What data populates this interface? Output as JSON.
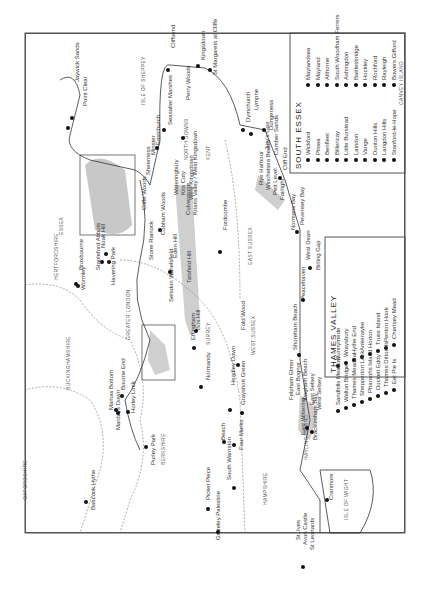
{
  "map": {
    "orientation": "rotated 90 degrees counter-clockwise",
    "insets": [
      {
        "title": "SOUTH ESSEX",
        "x": 290,
        "y": 33,
        "w": 115,
        "h": 140
      },
      {
        "title": "THAMES VALLEY",
        "x": 325,
        "y": 237,
        "w": 80,
        "h": 140
      }
    ],
    "counties": [
      {
        "name": "ESSEX",
        "x": 58,
        "y": 235
      },
      {
        "name": "HERTFORDSHIRE",
        "x": 53,
        "y": 280
      },
      {
        "name": "BUCKINGHAMSHIRE",
        "x": 65,
        "y": 390
      },
      {
        "name": "OXFORDSHIRE",
        "x": 22,
        "y": 500
      },
      {
        "name": "BERKSHIRE",
        "x": 160,
        "y": 465
      },
      {
        "name": "GREATER LONDON",
        "x": 125,
        "y": 340
      },
      {
        "name": "SURREY",
        "x": 205,
        "y": 345
      },
      {
        "name": "KENT",
        "x": 205,
        "y": 160
      },
      {
        "name": "NORTH DOWNS",
        "x": 183,
        "y": 160
      },
      {
        "name": "ISLE OF SHEPPEY",
        "x": 140,
        "y": 105
      },
      {
        "name": "EAST SUSSEX",
        "x": 247,
        "y": 265
      },
      {
        "name": "WEST SUSSEX",
        "x": 250,
        "y": 355
      },
      {
        "name": "HAMPSHIRE",
        "x": 262,
        "y": 505
      },
      {
        "name": "ISLE OF WIGHT",
        "x": 343,
        "y": 520
      },
      {
        "name": "HAYLING ISLAND",
        "x": 303,
        "y": 460
      },
      {
        "name": "CANVEY ISLAND",
        "x": 398,
        "y": 105
      }
    ],
    "places": [
      {
        "name": "Jaywick Sands",
        "x": 74,
        "y": 82,
        "dot": [
          72,
          118
        ]
      },
      {
        "name": "Point Clear",
        "x": 82,
        "y": 106,
        "dot": [
          68,
          128
        ]
      },
      {
        "name": "Sheerness",
        "x": 145,
        "y": 175
      },
      {
        "name": "Minster",
        "x": 150,
        "y": 155
      },
      {
        "name": "Eastchurch",
        "x": 155,
        "y": 145,
        "dot": [
          157,
          148
        ]
      },
      {
        "name": "Seasalter Marshes",
        "x": 167,
        "y": 125,
        "dot": [
          164,
          130
        ]
      },
      {
        "name": "Perry Woods",
        "x": 185,
        "y": 100,
        "dot": [
          183,
          138
        ]
      },
      {
        "name": "Kingsdown",
        "x": 200,
        "y": 60,
        "dot": [
          198,
          66
        ]
      },
      {
        "name": "Cliffsend",
        "x": 170,
        "y": 48,
        "dot": [
          168,
          70
        ]
      },
      {
        "name": "St Margarets at Cliffe",
        "x": 212,
        "y": 75,
        "dot": [
          210,
          70
        ]
      },
      {
        "name": "Dymchurch",
        "x": 245,
        "y": 122,
        "dot": [
          243,
          130
        ]
      },
      {
        "name": "Lympne",
        "x": 253,
        "y": 110,
        "dot": [
          251,
          134
        ]
      },
      {
        "name": "Dungeness",
        "x": 268,
        "y": 130,
        "dot": [
          264,
          130
        ]
      },
      {
        "name": "Jury's Gap",
        "x": 264,
        "y": 150
      },
      {
        "name": "Camber Sands",
        "x": 273,
        "y": 155
      },
      {
        "name": "Cliff End",
        "x": 282,
        "y": 170,
        "dot": [
          280,
          178
        ]
      },
      {
        "name": "Rye Harbour",
        "x": 258,
        "y": 185
      },
      {
        "name": "Winchelsea Beach",
        "x": 265,
        "y": 190
      },
      {
        "name": "Pett Level",
        "x": 272,
        "y": 195
      },
      {
        "name": "Fairlight",
        "x": 279,
        "y": 200
      },
      {
        "name": "Wateringbury",
        "x": 173,
        "y": 195
      },
      {
        "name": "Kits Coty",
        "x": 180,
        "y": 195
      },
      {
        "name": "West Kingsdown",
        "x": 188,
        "y": 200
      },
      {
        "name": "Culverstone",
        "x": 185,
        "y": 215
      },
      {
        "name": "Knatts Valley / West Kingsdown",
        "x": 192,
        "y": 215
      },
      {
        "name": "Cliffe Woods",
        "x": 141,
        "y": 210
      },
      {
        "name": "Cobham Woods",
        "x": 160,
        "y": 235,
        "dot": [
          160,
          230
        ]
      },
      {
        "name": "Stone Rainock",
        "x": 148,
        "y": 260
      },
      {
        "name": "Fordcombe",
        "x": 222,
        "y": 230,
        "dot": [
          220,
          252
        ]
      },
      {
        "name": "Eden Hill",
        "x": 172,
        "y": 258
      },
      {
        "name": "Chelsfield",
        "x": 168,
        "y": 275,
        "dot": [
          170,
          272
        ]
      },
      {
        "name": "Tatsfield Hill",
        "x": 186,
        "y": 283
      },
      {
        "name": "Selsdon Wd",
        "x": 168,
        "y": 302
      },
      {
        "name": "Box Hill",
        "x": 195,
        "y": 330,
        "dot": [
          196,
          331
        ]
      },
      {
        "name": "Effingham",
        "x": 190,
        "y": 340,
        "dot": [
          194,
          348
        ]
      },
      {
        "name": "Normandy",
        "x": 205,
        "y": 380,
        "dot": [
          201,
          387
        ]
      },
      {
        "name": "Fold Wood",
        "x": 240,
        "y": 330,
        "dot": [
          238,
          365
        ]
      },
      {
        "name": "Headley Down",
        "x": 230,
        "y": 385,
        "dot": [
          230,
          410
        ]
      },
      {
        "name": "Grayshott Green",
        "x": 240,
        "y": 405,
        "dot": [
          242,
          413
        ]
      },
      {
        "name": "Beach",
        "x": 220,
        "y": 440,
        "dot": [
          224,
          442
        ]
      },
      {
        "name": "Four Marks",
        "x": 238,
        "y": 450,
        "dot": [
          234,
          445
        ]
      },
      {
        "name": "South Warnston",
        "x": 226,
        "y": 480,
        "dot": [
          234,
          488
        ]
      },
      {
        "name": "Picket Piece",
        "x": 205,
        "y": 500,
        "dot": [
          208,
          509
        ]
      },
      {
        "name": "Grateley Palestine",
        "x": 215,
        "y": 540,
        "dot": [
          218,
          532
        ]
      },
      {
        "name": "Babcock Hythe",
        "x": 90,
        "y": 510,
        "dot": [
          86,
          502
        ]
      },
      {
        "name": "Purley Park",
        "x": 150,
        "y": 465,
        "dot": [
          146,
          447
        ]
      },
      {
        "name": "Marlow Bottom",
        "x": 108,
        "y": 410,
        "dot": [
          116,
          410
        ]
      },
      {
        "name": "Mardays Down",
        "x": 115,
        "y": 430,
        "dot": [
          118,
          413
        ]
      },
      {
        "name": "Bourne End",
        "x": 120,
        "y": 390,
        "dot": [
          122,
          396
        ]
      },
      {
        "name": "Hurley Lock",
        "x": 130,
        "y": 413,
        "dot": [
          128,
          412
        ]
      },
      {
        "name": "Wormley",
        "x": 80,
        "y": 290,
        "dot": [
          78,
          286
        ]
      },
      {
        "name": "Broxbourne",
        "x": 78,
        "y": 270,
        "dot": [
          76,
          284
        ]
      },
      {
        "name": "Stapleford Abbots",
        "x": 95,
        "y": 270,
        "dot": [
          102,
          262
        ]
      },
      {
        "name": "Havering Park",
        "x": 110,
        "y": 285,
        "dot": [
          109,
          262
        ]
      },
      {
        "name": "Noak Hill",
        "x": 100,
        "y": 248,
        "dot": [
          106,
          254
        ]
      },
      {
        "name": "Felpham Elmer",
        "x": 288,
        "y": 400,
        "dot": [
          307,
          428
        ]
      },
      {
        "name": "East Bognor",
        "x": 295,
        "y": 395
      },
      {
        "name": "Pagham Beach",
        "x": 302,
        "y": 400
      },
      {
        "name": "East Selsey",
        "x": 309,
        "y": 405
      },
      {
        "name": "West Selsey",
        "x": 316,
        "y": 410
      },
      {
        "name": "East Wittering",
        "x": 300,
        "y": 435,
        "dot": [
          312,
          432
        ]
      },
      {
        "name": "Bracklesham Bay",
        "x": 312,
        "y": 440
      },
      {
        "name": "Shoreham Beach",
        "x": 292,
        "y": 350,
        "dot": [
          299,
          355
        ]
      },
      {
        "name": "Peacehaven",
        "x": 300,
        "y": 300,
        "dot": [
          303,
          300
        ]
      },
      {
        "name": "Birling Gap",
        "x": 315,
        "y": 270
      },
      {
        "name": "West Dean",
        "x": 305,
        "y": 260,
        "dot": [
          310,
          268
        ]
      },
      {
        "name": "Normans Bay",
        "x": 290,
        "y": 230
      },
      {
        "name": "Pevensey Bay",
        "x": 299,
        "y": 225,
        "dot": [
          297,
          232
        ]
      },
      {
        "name": "Cranmore",
        "x": 328,
        "y": 500,
        "dot": [
          327,
          500
        ]
      },
      {
        "name": "St. Ives",
        "x": 295,
        "y": 540
      },
      {
        "name": "Avon Castle",
        "x": 302,
        "y": 545,
        "dot": [
          303,
          567
        ]
      },
      {
        "name": "St Leonards",
        "x": 309,
        "y": 550
      }
    ],
    "south_essex_places": [
      "Maylandsea",
      "Mayland",
      "Althorne",
      "South Woodham Ferrers",
      "Ashingdon",
      "Battlesbridge",
      "Hockley",
      "Rochford",
      "Rayleigh",
      "Bowers Gifford",
      "Wickford",
      "Pitsea",
      "Benfleet",
      "Billericay",
      "Little Burstead",
      "Laindon",
      "Vange",
      "Dunton Hills",
      "Langdon Hills",
      "Stanford-le-Hope"
    ],
    "thames_valley_places": [
      "Runnymede",
      "Wraysbury",
      "Hythe End",
      "Ankerwyke",
      "Horton",
      "Truss Island",
      "Penton Hook",
      "Chertsey Mead",
      "Sandhills Meadow",
      "Walton Bridge",
      "Thames Meadow",
      "Shepperton Lock",
      "Pharaohs Island",
      "Dockett Eddy",
      "Thames Ditton Is",
      "Eel Pie Is"
    ],
    "colors": {
      "shade": "#c8c8c8",
      "line": "#333333",
      "border": "#555555",
      "dot": "#111111"
    }
  }
}
